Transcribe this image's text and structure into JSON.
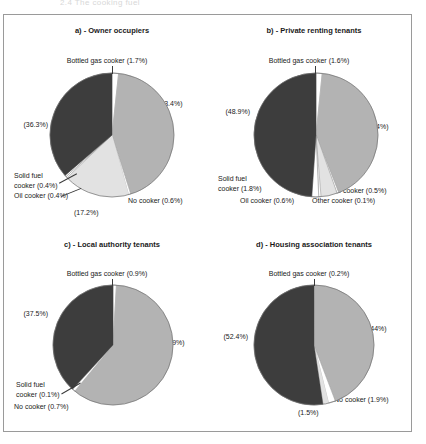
{
  "page": {
    "top_caption": "2.4 The cooking fuel",
    "frame_color": "#9a9a9a"
  },
  "palette": {
    "dark_gray": "#3d3d3d",
    "mid_gray": "#b3b3b3",
    "light_gray": "#e2e2e2",
    "white": "#ffffff",
    "outline": "#707070",
    "text": "#1a1a1a"
  },
  "chart_data": [
    {
      "type": "pie",
      "id": "a",
      "title": "a) - Owner occupiers",
      "categories": [
        "Gas cooker",
        "Electric cooker",
        "No cooker",
        "Oil cooker",
        "Solid fuel cooker",
        "Bottled gas cooker"
      ],
      "values": [
        43.4,
        17.2,
        0.6,
        0.4,
        0.4,
        1.7
      ],
      "dark_value": 36.3,
      "labels": {
        "top": "Bottled gas cooker (1.7%)",
        "right": "(43.4%)",
        "left": "(36.3%)",
        "bottom_left_1": "Solid fuel",
        "bottom_left_2": "cooker (0.4%)",
        "bottom_left_3": "Oil cooker (0.4%)",
        "bottom_center": "(17.2%)",
        "bottom_right": "No cooker (0.6%)"
      },
      "slices": [
        {
          "name": "bottled-gas",
          "pct": 1.7,
          "color": "#ffffff"
        },
        {
          "name": "mid-slice",
          "pct": 43.4,
          "color": "#b3b3b3"
        },
        {
          "name": "no-cooker",
          "pct": 0.6,
          "color": "#ffffff"
        },
        {
          "name": "light-slice",
          "pct": 17.2,
          "color": "#e2e2e2"
        },
        {
          "name": "oil-cooker",
          "pct": 0.4,
          "color": "#ffffff"
        },
        {
          "name": "solid-fuel",
          "pct": 0.4,
          "color": "#ffffff"
        },
        {
          "name": "dark-slice",
          "pct": 36.3,
          "color": "#3d3d3d"
        }
      ]
    },
    {
      "type": "pie",
      "id": "b",
      "title": "b) - Private renting tenants",
      "categories": [
        "Gas cooker",
        "Electric cooker",
        "No cooker",
        "Other cooker",
        "Oil cooker",
        "Solid fuel cooker",
        "Bottled gas cooker"
      ],
      "values": [
        42.4,
        4.7,
        0.5,
        0.1,
        0.6,
        1.8,
        1.6
      ],
      "dark_value": 48.9,
      "labels": {
        "top": "Bottled gas cooker (1.6%)",
        "right": "(42.4%)",
        "left": "(48.9%)",
        "bottom_left_1": "Solid fuel",
        "bottom_left_2": "cooker (1.8%)",
        "bottom_left_3": "Oil cooker (0.6%)",
        "bottom_right_1": "No cooker (0.5%)",
        "bottom_right_2": "Other cooker (0.1%)"
      },
      "slices": [
        {
          "name": "bottled-gas",
          "pct": 1.6,
          "color": "#ffffff"
        },
        {
          "name": "mid-slice",
          "pct": 42.4,
          "color": "#b3b3b3"
        },
        {
          "name": "no-cooker",
          "pct": 0.5,
          "color": "#ffffff"
        },
        {
          "name": "other-cooker",
          "pct": 0.1,
          "color": "#ffffff"
        },
        {
          "name": "light-slice",
          "pct": 4.1,
          "color": "#e2e2e2"
        },
        {
          "name": "oil-cooker",
          "pct": 0.6,
          "color": "#ffffff"
        },
        {
          "name": "solid-fuel",
          "pct": 1.8,
          "color": "#ffffff"
        },
        {
          "name": "dark-slice",
          "pct": 48.9,
          "color": "#3d3d3d"
        }
      ]
    },
    {
      "type": "pie",
      "id": "c",
      "title": "c) - Local authority tenants",
      "categories": [
        "Electric cooker",
        "No cooker",
        "Solid fuel cooker",
        "Bottled gas cooker"
      ],
      "values": [
        59.0,
        0.7,
        0.1,
        0.9
      ],
      "dark_value": 37.5,
      "labels": {
        "top": "Bottled gas cooker (0.9%)",
        "right": "(59%)",
        "left": "(37.5%)",
        "bottom_left_1": "Solid fuel",
        "bottom_left_2": "cooker (0.1%)",
        "bottom_left_3": "No cooker (0.7%)"
      },
      "slices": [
        {
          "name": "bottled-gas",
          "pct": 0.9,
          "color": "#ffffff"
        },
        {
          "name": "mid-slice",
          "pct": 59.0,
          "color": "#b3b3b3"
        },
        {
          "name": "no-cooker",
          "pct": 0.7,
          "color": "#ffffff"
        },
        {
          "name": "solid-fuel",
          "pct": 0.1,
          "color": "#e2e2e2"
        },
        {
          "name": "dark-slice",
          "pct": 37.5,
          "color": "#3d3d3d"
        }
      ]
    },
    {
      "type": "pie",
      "id": "d",
      "title": "d) - Housing association tenants",
      "categories": [
        "Electric cooker",
        "No cooker",
        "Other",
        "Bottled gas cooker"
      ],
      "values": [
        44.0,
        1.9,
        1.5,
        0.2
      ],
      "dark_value": 52.4,
      "labels": {
        "top": "Bottled gas cooker (0.2%)",
        "right": "(44%)",
        "left": "(52.4%)",
        "bottom_right": "No cooker (1.9%)",
        "bottom_center": "(1.5%)"
      },
      "slices": [
        {
          "name": "bottled-gas",
          "pct": 0.2,
          "color": "#ffffff"
        },
        {
          "name": "mid-slice",
          "pct": 44.0,
          "color": "#b3b3b3"
        },
        {
          "name": "no-cooker",
          "pct": 1.9,
          "color": "#ffffff"
        },
        {
          "name": "other-slice",
          "pct": 1.5,
          "color": "#e2e2e2"
        },
        {
          "name": "dark-slice",
          "pct": 52.4,
          "color": "#3d3d3d"
        }
      ]
    }
  ]
}
